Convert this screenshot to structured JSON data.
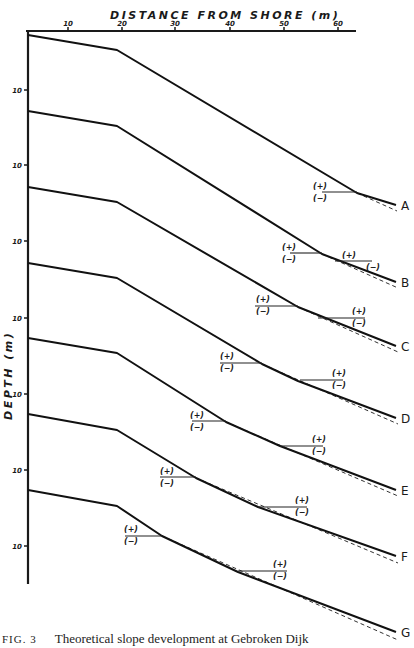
{
  "figure": {
    "x_axis_title": "DISTANCE FROM SHORE (m)",
    "y_axis_title": "DEPTH (m)",
    "x_ticks": [
      {
        "label": "10",
        "x": 68
      },
      {
        "label": "20",
        "x": 122
      },
      {
        "label": "30",
        "x": 175
      },
      {
        "label": "40",
        "x": 230
      },
      {
        "label": "50",
        "x": 284
      },
      {
        "label": "60",
        "x": 338
      }
    ],
    "y_tick_label": "10",
    "y_ticks_y": [
      90,
      165,
      241,
      318,
      394,
      470,
      546
    ],
    "waterline_plus": "(+)",
    "waterline_minus": "(−)",
    "profiles": [
      {
        "id": "A",
        "label": "A",
        "solid": [
          [
            28,
            35
          ],
          [
            117,
            50
          ],
          [
            357,
            193
          ],
          [
            396,
            205
          ]
        ],
        "dashed": [
          [
            357,
            193
          ],
          [
            397,
            211
          ]
        ],
        "markers": [
          {
            "x1": 322,
            "x2": 357,
            "y": 192,
            "lx": 313,
            "ly": 189
          }
        ]
      },
      {
        "id": "B",
        "label": "B",
        "solid": [
          [
            28,
            111
          ],
          [
            117,
            126
          ],
          [
            322,
            254
          ],
          [
            396,
            282
          ]
        ],
        "dashed": [
          [
            322,
            254
          ],
          [
            398,
            288
          ]
        ],
        "markers": [
          {
            "x1": 290,
            "x2": 322,
            "y": 253,
            "lx": 282,
            "ly": 250
          },
          {
            "x1": 335,
            "x2": 372,
            "y": 261,
            "lx": 342,
            "ly": 258,
            "lx2": 366,
            "ly2": 270
          }
        ]
      },
      {
        "id": "C",
        "label": "C",
        "solid": [
          [
            28,
            187
          ],
          [
            117,
            202
          ],
          [
            298,
            307
          ],
          [
            396,
            346
          ]
        ],
        "dashed": [
          [
            298,
            307
          ],
          [
            398,
            352
          ]
        ],
        "markers": [
          {
            "x1": 255,
            "x2": 298,
            "y": 306,
            "lx": 256,
            "ly": 302
          },
          {
            "x1": 318,
            "x2": 365,
            "y": 318,
            "lx": 352,
            "ly": 314
          }
        ]
      },
      {
        "id": "D",
        "label": "D",
        "solid": [
          [
            28,
            263
          ],
          [
            117,
            278
          ],
          [
            262,
            364
          ],
          [
            298,
            381
          ],
          [
            396,
            418
          ]
        ],
        "dashed": [
          [
            262,
            364
          ],
          [
            398,
            424
          ]
        ],
        "markers": [
          {
            "x1": 220,
            "x2": 262,
            "y": 363,
            "lx": 220,
            "ly": 359
          },
          {
            "x1": 300,
            "x2": 343,
            "y": 380,
            "lx": 332,
            "ly": 376
          }
        ]
      },
      {
        "id": "E",
        "label": "E",
        "solid": [
          [
            28,
            338
          ],
          [
            117,
            353
          ],
          [
            226,
            422
          ],
          [
            280,
            446
          ],
          [
            396,
            490
          ]
        ],
        "dashed": [
          [
            226,
            422
          ],
          [
            398,
            496
          ]
        ],
        "markers": [
          {
            "x1": 192,
            "x2": 226,
            "y": 421,
            "lx": 190,
            "ly": 418
          },
          {
            "x1": 280,
            "x2": 323,
            "y": 446,
            "lx": 312,
            "ly": 442
          }
        ]
      },
      {
        "id": "F",
        "label": "F",
        "solid": [
          [
            28,
            414
          ],
          [
            117,
            430
          ],
          [
            196,
            478
          ],
          [
            258,
            507
          ],
          [
            396,
            556
          ]
        ],
        "dashed": [
          [
            196,
            478
          ],
          [
            398,
            563
          ]
        ],
        "markers": [
          {
            "x1": 160,
            "x2": 196,
            "y": 477,
            "lx": 160,
            "ly": 474
          },
          {
            "x1": 258,
            "x2": 307,
            "y": 507,
            "lx": 295,
            "ly": 503
          }
        ]
      },
      {
        "id": "G",
        "label": "G",
        "solid": [
          [
            28,
            490
          ],
          [
            117,
            506
          ],
          [
            162,
            536
          ],
          [
            238,
            572
          ],
          [
            396,
            632
          ]
        ],
        "dashed": [
          [
            162,
            536
          ],
          [
            398,
            640
          ]
        ],
        "markers": [
          {
            "x1": 125,
            "x2": 162,
            "y": 536,
            "lx": 124,
            "ly": 532
          },
          {
            "x1": 238,
            "x2": 287,
            "y": 571,
            "lx": 273,
            "ly": 567
          }
        ]
      }
    ]
  },
  "caption": {
    "fig_no": "FIG. 3",
    "text": "Theoretical slope development at Gebroken Dijk"
  }
}
